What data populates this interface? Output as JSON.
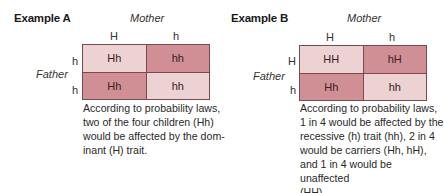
{
  "examples": [
    {
      "title": "Example A",
      "mother_label": "Mother",
      "father_label": "Father",
      "mother_alleles": [
        "H",
        "h"
      ],
      "father_alleles": [
        "h",
        "h"
      ],
      "cells": [
        {
          "value": "Hh",
          "shade": "light"
        },
        {
          "value": "hh",
          "shade": "dark"
        },
        {
          "value": "Hh",
          "shade": "dark"
        },
        {
          "value": "hh",
          "shade": "light"
        }
      ],
      "caption_lines": [
        "According to probability laws,",
        "two of the four children (Hh)",
        "would be affected by the dom-",
        "inant (H) trait."
      ]
    },
    {
      "title": "Example B",
      "mother_label": "Mother",
      "father_label": "Father",
      "mother_alleles": [
        "H",
        "h"
      ],
      "father_alleles": [
        "H",
        "h"
      ],
      "cells": [
        {
          "value": "HH",
          "shade": "light"
        },
        {
          "value": "hH",
          "shade": "dark"
        },
        {
          "value": "Hh",
          "shade": "dark"
        },
        {
          "value": "hh",
          "shade": "light"
        }
      ],
      "caption_lines": [
        "According to probability laws,",
        "1 in 4 would be affected by the",
        "recessive (h) trait (hh), 2 in 4",
        "would be carriers (Hh, hH),",
        "and 1 in 4 would be unaffected",
        "(HH)."
      ]
    }
  ],
  "colors": {
    "light_cell": "#ecd2d3",
    "dark_cell": "#cf8f94",
    "grid_border": "#7a4a4e"
  }
}
